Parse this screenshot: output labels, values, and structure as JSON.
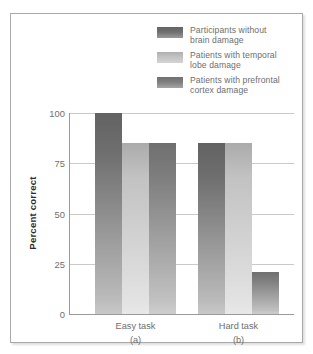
{
  "chart_data": {
    "type": "bar",
    "title": "",
    "subtitle": "",
    "xlabel": "",
    "ylabel": "Percent correct",
    "ylim": [
      0,
      100
    ],
    "yticks": [
      0,
      25,
      50,
      75,
      100
    ],
    "ytick_labels": [
      "0",
      "25",
      "50",
      "75",
      "100"
    ],
    "grid": true,
    "legend_position": "top-right",
    "categories": [
      "Easy task",
      "Hard task"
    ],
    "category_sublabels": [
      "(a)",
      "(b)"
    ],
    "series": [
      {
        "name": "Participants without\nbrain damage",
        "color": "#6f6f6f",
        "values": [
          100,
          85
        ]
      },
      {
        "name": "Patients with temporal\nlobe damage",
        "color": "#c2c2c2",
        "values": [
          85,
          85
        ]
      },
      {
        "name": "Patients with prefrontal\ncortex damage",
        "color": "#7e7e7e",
        "values": [
          85,
          21
        ]
      }
    ]
  },
  "legend": {
    "items": [
      {
        "label": "Participants without\nbrain damage",
        "swatch": "#6f6f6f"
      },
      {
        "label": "Patients with temporal\nlobe damage",
        "swatch": "#c2c2c2"
      },
      {
        "label": "Patients with prefrontal\ncortex damage",
        "swatch": "#7e7e7e"
      }
    ]
  },
  "axis": {
    "y_title": "Percent correct",
    "y_labels": [
      "100",
      "75",
      "50",
      "25",
      "0"
    ]
  },
  "groups": [
    {
      "label": "Easy task",
      "sublabel": "(a)"
    },
    {
      "label": "Hard task",
      "sublabel": "(b)"
    }
  ],
  "colors": {
    "series1": "#6f6f6f",
    "series2": "#c2c2c2",
    "series3": "#7e7e7e",
    "axis": "#9a9a9a",
    "grid": "#c9c9c9",
    "text": "#6e6e6e",
    "frame": "#a8a8a8"
  }
}
